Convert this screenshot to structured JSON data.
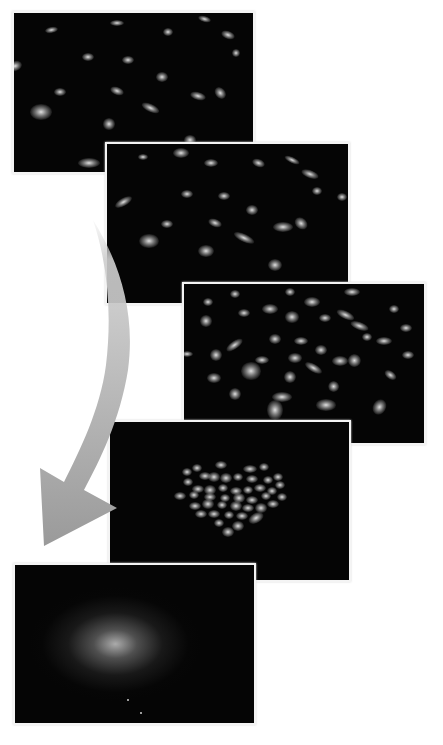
{
  "figure": {
    "colors": {
      "background": "#ffffff",
      "panel": "#050505",
      "panel_border": "#f4f4f4",
      "arrow": "#a8a8a8",
      "particle": "#e6e6e6"
    },
    "panels": [
      {
        "id": "stage-1",
        "state": "dispersed-sparse",
        "box": {
          "x": 14,
          "y": 13,
          "w": 239,
          "h": 159
        },
        "particles": [
          [
            37,
            17,
            8,
            4,
            -10
          ],
          [
            103,
            10,
            9,
            4,
            0
          ],
          [
            154,
            19,
            6,
            5,
            0
          ],
          [
            190,
            6,
            8,
            4,
            15
          ],
          [
            214,
            22,
            9,
            5,
            20
          ],
          [
            222,
            40,
            5,
            5,
            0
          ],
          [
            74,
            44,
            7,
            5,
            0
          ],
          [
            114,
            47,
            7,
            5,
            0
          ],
          [
            148,
            64,
            7,
            6,
            0
          ],
          [
            1,
            53,
            9,
            6,
            -20
          ],
          [
            46,
            79,
            8,
            5,
            0
          ],
          [
            103,
            78,
            9,
            5,
            20
          ],
          [
            184,
            83,
            10,
            5,
            15
          ],
          [
            206,
            80,
            8,
            6,
            50
          ],
          [
            137,
            95,
            12,
            5,
            25
          ],
          [
            27,
            99,
            14,
            10,
            0
          ],
          [
            95,
            111,
            8,
            7,
            0
          ],
          [
            176,
            127,
            8,
            6,
            0
          ],
          [
            75,
            150,
            14,
            6,
            0
          ]
        ]
      },
      {
        "id": "stage-2",
        "state": "dispersed",
        "box": {
          "x": 107,
          "y": 144,
          "w": 241,
          "h": 159
        },
        "particles": [
          [
            36,
            13,
            6,
            4,
            0
          ],
          [
            74,
            9,
            10,
            6,
            0
          ],
          [
            104,
            19,
            9,
            5,
            0
          ],
          [
            151,
            19,
            8,
            5,
            20
          ],
          [
            185,
            16,
            10,
            4,
            25
          ],
          [
            203,
            30,
            11,
            5,
            20
          ],
          [
            210,
            47,
            6,
            5,
            0
          ],
          [
            235,
            53,
            6,
            5,
            0
          ],
          [
            80,
            50,
            7,
            5,
            0
          ],
          [
            117,
            52,
            7,
            5,
            0
          ],
          [
            17,
            58,
            12,
            5,
            -30
          ],
          [
            145,
            66,
            7,
            6,
            0
          ],
          [
            60,
            80,
            7,
            5,
            0
          ],
          [
            108,
            79,
            9,
            5,
            20
          ],
          [
            176,
            83,
            12,
            6,
            0
          ],
          [
            194,
            80,
            9,
            7,
            40
          ],
          [
            137,
            94,
            14,
            5,
            25
          ],
          [
            42,
            97,
            12,
            9,
            0
          ],
          [
            99,
            107,
            10,
            8,
            0
          ],
          [
            168,
            121,
            9,
            8,
            0
          ],
          [
            148,
            157,
            10,
            5,
            0
          ]
        ]
      },
      {
        "id": "stage-3",
        "state": "dispersed-dense",
        "box": {
          "x": 184,
          "y": 284,
          "w": 240,
          "h": 159
        },
        "particles": [
          [
            24,
            18,
            6,
            5,
            0
          ],
          [
            51,
            10,
            6,
            5,
            0
          ],
          [
            106,
            8,
            6,
            5,
            0
          ],
          [
            168,
            8,
            10,
            5,
            0
          ],
          [
            128,
            18,
            10,
            6,
            0
          ],
          [
            86,
            25,
            10,
            6,
            0
          ],
          [
            60,
            29,
            7,
            5,
            0
          ],
          [
            108,
            33,
            9,
            7,
            0
          ],
          [
            141,
            34,
            7,
            5,
            0
          ],
          [
            162,
            31,
            12,
            5,
            25
          ],
          [
            210,
            25,
            6,
            5,
            0
          ],
          [
            22,
            37,
            7,
            7,
            0
          ],
          [
            176,
            42,
            12,
            5,
            20
          ],
          [
            222,
            44,
            7,
            5,
            0
          ],
          [
            183,
            53,
            6,
            5,
            0
          ],
          [
            200,
            57,
            10,
            5,
            0
          ],
          [
            91,
            55,
            7,
            6,
            0
          ],
          [
            117,
            57,
            9,
            5,
            0
          ],
          [
            51,
            61,
            12,
            5,
            -35
          ],
          [
            137,
            66,
            7,
            6,
            0
          ],
          [
            3,
            70,
            8,
            4,
            0
          ],
          [
            32,
            71,
            8,
            8,
            0
          ],
          [
            78,
            76,
            9,
            5,
            0
          ],
          [
            111,
            74,
            9,
            6,
            0
          ],
          [
            156,
            77,
            10,
            6,
            0
          ],
          [
            170,
            76,
            8,
            8,
            40
          ],
          [
            224,
            71,
            7,
            5,
            0
          ],
          [
            130,
            84,
            12,
            5,
            30
          ],
          [
            67,
            87,
            12,
            11,
            0
          ],
          [
            206,
            91,
            8,
            5,
            35
          ],
          [
            30,
            94,
            9,
            6,
            0
          ],
          [
            106,
            93,
            8,
            8,
            0
          ],
          [
            150,
            103,
            7,
            7,
            60
          ],
          [
            51,
            110,
            8,
            8,
            0
          ],
          [
            98,
            113,
            12,
            6,
            0
          ],
          [
            142,
            121,
            12,
            7,
            0
          ],
          [
            195,
            123,
            8,
            10,
            30
          ],
          [
            91,
            126,
            10,
            12,
            0
          ]
        ]
      },
      {
        "id": "stage-4",
        "state": "aggregating-cluster",
        "box": {
          "x": 110,
          "y": 422,
          "w": 239,
          "h": 158
        },
        "cluster_center": {
          "x": 125,
          "y": 73
        },
        "particles": [
          [
            87,
            46,
            6,
            5,
            0
          ],
          [
            111,
            43,
            7,
            5,
            0
          ],
          [
            140,
            47,
            9,
            5,
            0
          ],
          [
            154,
            45,
            6,
            5,
            0
          ],
          [
            77,
            50,
            6,
            5,
            0
          ],
          [
            95,
            54,
            7,
            5,
            0
          ],
          [
            104,
            55,
            8,
            6,
            0
          ],
          [
            116,
            56,
            7,
            6,
            0
          ],
          [
            128,
            55,
            6,
            5,
            0
          ],
          [
            142,
            57,
            7,
            5,
            0
          ],
          [
            158,
            58,
            6,
            5,
            0
          ],
          [
            168,
            55,
            6,
            5,
            0
          ],
          [
            78,
            60,
            6,
            5,
            0
          ],
          [
            170,
            63,
            6,
            5,
            0
          ],
          [
            88,
            67,
            8,
            5,
            0
          ],
          [
            100,
            68,
            7,
            6,
            0
          ],
          [
            113,
            66,
            6,
            5,
            0
          ],
          [
            126,
            69,
            7,
            5,
            0
          ],
          [
            138,
            68,
            6,
            5,
            0
          ],
          [
            150,
            66,
            7,
            5,
            0
          ],
          [
            162,
            69,
            6,
            5,
            0
          ],
          [
            70,
            74,
            7,
            5,
            0
          ],
          [
            84,
            73,
            6,
            5,
            0
          ],
          [
            100,
            75,
            7,
            5,
            0
          ],
          [
            115,
            76,
            6,
            5,
            0
          ],
          [
            129,
            76,
            7,
            6,
            0
          ],
          [
            142,
            78,
            7,
            5,
            0
          ],
          [
            156,
            74,
            6,
            5,
            0
          ],
          [
            172,
            75,
            6,
            5,
            0
          ],
          [
            85,
            84,
            7,
            5,
            0
          ],
          [
            98,
            82,
            8,
            6,
            0
          ],
          [
            112,
            83,
            6,
            5,
            0
          ],
          [
            126,
            84,
            7,
            6,
            0
          ],
          [
            138,
            86,
            7,
            5,
            0
          ],
          [
            151,
            86,
            8,
            6,
            0
          ],
          [
            163,
            82,
            7,
            5,
            0
          ],
          [
            91,
            92,
            7,
            5,
            0
          ],
          [
            104,
            92,
            7,
            5,
            0
          ],
          [
            119,
            93,
            6,
            5,
            0
          ],
          [
            132,
            94,
            7,
            5,
            0
          ],
          [
            146,
            96,
            10,
            6,
            -30
          ],
          [
            109,
            101,
            6,
            5,
            0
          ],
          [
            128,
            104,
            7,
            6,
            0
          ],
          [
            118,
            110,
            7,
            6,
            0
          ],
          [
            -3,
            79,
            3,
            3,
            0
          ]
        ]
      },
      {
        "id": "stage-5",
        "state": "diffuse-aggregate",
        "box": {
          "x": 15,
          "y": 565,
          "w": 239,
          "h": 158
        },
        "glow": {
          "cx": 42,
          "cy": 50,
          "rx": 36,
          "ry": 36
        },
        "specks": [
          [
            112,
            134
          ],
          [
            125,
            147
          ]
        ]
      }
    ],
    "arrow": {
      "label": "progression-arrow",
      "path": "curved downward-left sweep from top of stage 2 to beside stage 5",
      "start": {
        "x": 95,
        "y": 222
      },
      "head_tip": {
        "x": 44,
        "y": 546
      },
      "head_wings": [
        {
          "x": 40,
          "y": 468
        },
        {
          "x": 117,
          "y": 508
        }
      ]
    }
  }
}
